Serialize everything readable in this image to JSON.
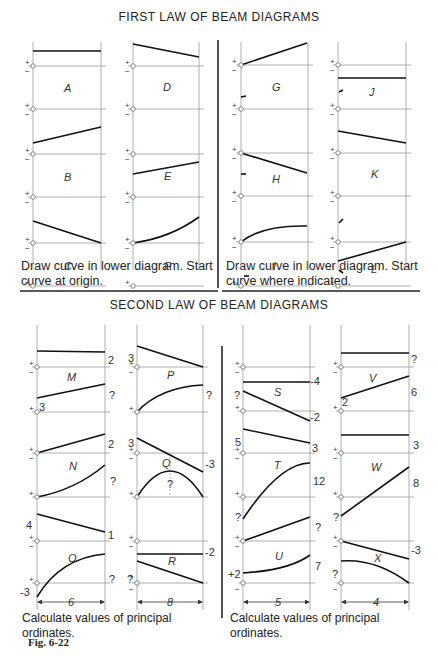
{
  "first_law": {
    "title": "FIRST LAW OF BEAM DIAGRAMS",
    "left_caption": "Draw curve in lower diagram. Start curve at origin.",
    "right_caption": "Draw curve in lower diagram. Start curve where indicated.",
    "panels": [
      "A",
      "B",
      "C",
      "D",
      "E",
      "F",
      "G",
      "H",
      "I",
      "J",
      "K",
      "L"
    ]
  },
  "second_law": {
    "title": "SECOND LAW OF BEAM DIAGRAMS",
    "left_caption": "Calculate values of principal ordinates.",
    "right_caption": "Calculate values of principal ordinates.",
    "panels": {
      "M": {
        "upper_right": "2",
        "lower_left": "3",
        "lower_right": "?"
      },
      "P": {
        "upper_left": "3",
        "lower_right": "?"
      },
      "N": {
        "upper_right": "2",
        "lower_right": "?"
      },
      "Q": {
        "upper_left": "3",
        "upper_right": "-3",
        "lower_mid": "?"
      },
      "O": {
        "upper_left": "4",
        "upper_right": "1",
        "lower_left": "-3",
        "lower_right": "?"
      },
      "R": {
        "upper_right": "-2",
        "lower_left": "?"
      },
      "S": {
        "upper_right": "-4",
        "lower_left": "?",
        "lower_right": "-2"
      },
      "V": {
        "upper_right": "?",
        "lower_left": "2",
        "lower_right": "6"
      },
      "T": {
        "upper_left": "5",
        "upper_right": "3",
        "lower_left": "?",
        "lower_right": "12"
      },
      "W": {
        "upper_right": "3",
        "lower_left": "?",
        "lower_right": "8"
      },
      "U": {
        "upper_right": "?",
        "lower_left": "+2",
        "lower_right": "7"
      },
      "X": {
        "upper_right": "-3",
        "lower_left": "?"
      }
    },
    "spans": {
      "left_col1": "6",
      "left_col2": "8",
      "right_col1": "5",
      "right_col2": "4"
    }
  },
  "figure_label": "Fig. 6-22",
  "signs": {
    "plus": "+",
    "minus": "−"
  }
}
